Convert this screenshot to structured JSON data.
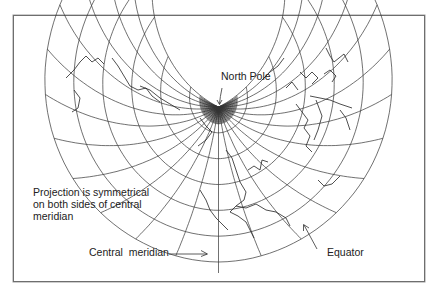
{
  "figure": {
    "type": "map-projection-diagram",
    "labels": {
      "north_pole": "North Pole",
      "symmetry_note_lines": [
        "Projection is symmetrical",
        "on both sides of central",
        "meridian"
      ],
      "central_meridian": "Central  meridian",
      "equator": "Equator"
    },
    "colors": {
      "line": "#333333",
      "frame": "#6e6e6e",
      "background": "#ffffff",
      "text": "#222222"
    },
    "annotations": [
      {
        "name": "north-pole-arrow",
        "points_to": "North Pole"
      },
      {
        "name": "central-meridian-arrow",
        "points_to": "Central meridian"
      },
      {
        "name": "equator-arrow",
        "points_to": "Equator"
      }
    ]
  }
}
